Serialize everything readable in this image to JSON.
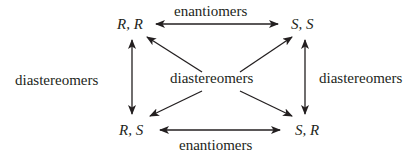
{
  "nodes": {
    "top_left": "R, R",
    "top_right": "S, S",
    "bottom_left": "R, S",
    "bottom_right": "S, R"
  },
  "relations": {
    "top": "enantiomers",
    "bottom": "enantiomers",
    "left": "diastereomers",
    "right": "diastereomers",
    "center": "diastereomers"
  },
  "colors": {
    "ink": "#231f20",
    "background": "#ffffff"
  }
}
